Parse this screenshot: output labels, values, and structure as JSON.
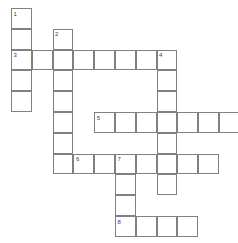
{
  "puzzle": {
    "type": "crossword-grid",
    "title": "Crossword Puzzle Grid",
    "cell_size": 20.8,
    "origin_x": 11,
    "origin_y": 8,
    "columns": 11,
    "rows": 11,
    "colors": {
      "cell_fill": "#ffffff",
      "cell_border": "#808080",
      "number_text": "#3c3c3c",
      "background": "#ffffff"
    },
    "entries": [
      {
        "number": "1",
        "direction": "down",
        "row": 0,
        "col": 0,
        "length": 5
      },
      {
        "number": "2",
        "direction": "down",
        "row": 1,
        "col": 2,
        "length": 7
      },
      {
        "number": "3",
        "direction": "across",
        "row": 2,
        "col": 0,
        "length": 8
      },
      {
        "number": "4",
        "direction": "down",
        "row": 2,
        "col": 7,
        "length": 7
      },
      {
        "number": "5",
        "direction": "across",
        "row": 5,
        "col": 4,
        "length": 7
      },
      {
        "number": "6",
        "direction": "across",
        "row": 7,
        "col": 3,
        "length": 7
      },
      {
        "number": "7",
        "direction": "down",
        "row": 7,
        "col": 5,
        "length": 4
      },
      {
        "number": "8",
        "direction": "across",
        "row": 10,
        "col": 5,
        "length": 4
      }
    ],
    "numbered_cells": [
      {
        "label": "1",
        "row": 0,
        "col": 0
      },
      {
        "label": "2",
        "row": 1,
        "col": 2
      },
      {
        "label": "3",
        "row": 2,
        "col": 0
      },
      {
        "label": "4",
        "row": 2,
        "col": 7
      },
      {
        "label": "5",
        "row": 5,
        "col": 4
      },
      {
        "label": "6",
        "row": 7,
        "col": 3
      },
      {
        "label": "7",
        "row": 7,
        "col": 5
      },
      {
        "label": "8",
        "row": 10,
        "col": 5
      }
    ],
    "cells": [
      {
        "row": 0,
        "col": 0
      },
      {
        "row": 1,
        "col": 0
      },
      {
        "row": 1,
        "col": 2
      },
      {
        "row": 2,
        "col": 0
      },
      {
        "row": 2,
        "col": 1
      },
      {
        "row": 2,
        "col": 2
      },
      {
        "row": 2,
        "col": 3
      },
      {
        "row": 2,
        "col": 4
      },
      {
        "row": 2,
        "col": 5
      },
      {
        "row": 2,
        "col": 6
      },
      {
        "row": 2,
        "col": 7
      },
      {
        "row": 3,
        "col": 0
      },
      {
        "row": 3,
        "col": 2
      },
      {
        "row": 3,
        "col": 7
      },
      {
        "row": 4,
        "col": 0
      },
      {
        "row": 4,
        "col": 2
      },
      {
        "row": 4,
        "col": 7
      },
      {
        "row": 5,
        "col": 2
      },
      {
        "row": 5,
        "col": 4
      },
      {
        "row": 5,
        "col": 5
      },
      {
        "row": 5,
        "col": 6
      },
      {
        "row": 5,
        "col": 7
      },
      {
        "row": 5,
        "col": 8
      },
      {
        "row": 5,
        "col": 9
      },
      {
        "row": 5,
        "col": 10
      },
      {
        "row": 6,
        "col": 2
      },
      {
        "row": 6,
        "col": 7
      },
      {
        "row": 7,
        "col": 2
      },
      {
        "row": 7,
        "col": 3
      },
      {
        "row": 7,
        "col": 4
      },
      {
        "row": 7,
        "col": 5
      },
      {
        "row": 7,
        "col": 6
      },
      {
        "row": 7,
        "col": 7
      },
      {
        "row": 7,
        "col": 8
      },
      {
        "row": 7,
        "col": 9
      },
      {
        "row": 8,
        "col": 5
      },
      {
        "row": 8,
        "col": 7
      },
      {
        "row": 9,
        "col": 5
      },
      {
        "row": 10,
        "col": 5
      },
      {
        "row": 10,
        "col": 6
      },
      {
        "row": 10,
        "col": 7
      },
      {
        "row": 10,
        "col": 8
      }
    ]
  }
}
